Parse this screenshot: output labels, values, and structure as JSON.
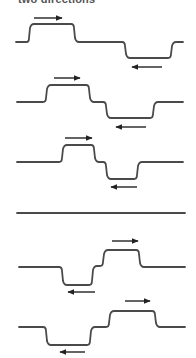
{
  "caption": "two directions",
  "colors": {
    "wave": "#4a4a4a",
    "arrow": "#222222",
    "background": "#ffffff"
  },
  "waves": [
    {
      "name": "wave-1",
      "path": "M16,42 L27,42 Q29,42 29,38 L30,28 Q31,24 34,24 L71,24 Q74,24 74,28 L75,38 Q76,42 79,42 L122,42 Q125,42 125,46 L126,54 Q127,58 130,58 L168,58 Q171,58 171,54 L172,46 Q173,42 176,42 L183,42",
      "arrows": [
        {
          "x1": 34,
          "x2": 62,
          "y": 18,
          "dir": "right"
        },
        {
          "x1": 132,
          "x2": 162,
          "y": 67,
          "dir": "left"
        }
      ]
    },
    {
      "name": "wave-2",
      "path": "M17,102 L43,102 Q46,102 46,98 L47,89 Q48,85 51,85 L86,85 Q89,85 89,89 L90,98 Q91,102 94,102 L103,102 Q106,102 106,106 L107,114 Q108,118 111,118 L150,118 Q153,118 153,114 L154,106 Q155,102 158,102 L183,102",
      "arrows": [
        {
          "x1": 54,
          "x2": 80,
          "y": 78,
          "dir": "right"
        },
        {
          "x1": 132,
          "x2": 162,
          "y": 67,
          "dir": "none"
        },
        {
          "x1": 116,
          "x2": 146,
          "y": 127,
          "dir": "left"
        }
      ]
    },
    {
      "name": "wave-3",
      "path": "M17,162 L59,162 Q62,162 62,158 L63,149 Q64,145 67,145 L91,145 Q94,145 94,149 L95,158 Q96,162 99,162 L103,162 Q106,162 106,166 L107,175 Q108,179 111,179 L134,179 Q137,179 137,175 L138,166 Q139,162 142,162 L183,162",
      "arrows": [
        {
          "x1": 65,
          "x2": 92,
          "y": 138,
          "dir": "right"
        },
        {
          "x1": 111,
          "x2": 137,
          "y": 187,
          "dir": "left"
        }
      ]
    },
    {
      "name": "flat-line",
      "path": "M17,213 L185,213",
      "arrows": []
    },
    {
      "name": "wave-4",
      "path": "M19,267 L59,267 Q62,267 62,271 L63,281 Q64,285 67,285 L89,285 Q92,285 92,281 L93,270 Q94,266 97,266 L100,266 Q103,266 103,262 L104,254 Q105,250 108,250 L136,250 Q139,250 139,254 L140,263 Q141,267 144,267 L185,267",
      "arrows": [
        {
          "x1": 112,
          "x2": 138,
          "y": 241,
          "dir": "right"
        },
        {
          "x1": 68,
          "x2": 95,
          "y": 292,
          "dir": "left"
        }
      ]
    },
    {
      "name": "wave-5",
      "path": "M19,327 L43,327 Q46,327 46,331 L47,341 Q48,345 51,345 L87,345 Q90,345 90,341 L91,331 Q92,327 95,327 L106,327 Q109,327 109,323 L110,315 Q111,311 114,311 L152,311 Q155,311 155,315 L156,323 Q157,327 160,327 L185,327",
      "arrows": [
        {
          "x1": 125,
          "x2": 150,
          "y": 301,
          "dir": "right"
        },
        {
          "x1": 60,
          "x2": 85,
          "y": 352,
          "dir": "left"
        }
      ]
    }
  ]
}
